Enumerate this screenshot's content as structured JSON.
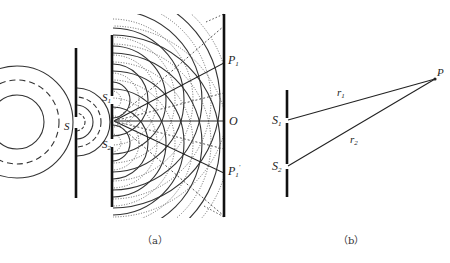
{
  "figure_a": {
    "caption": "（a）",
    "source_label": "S",
    "slit1_label": "S",
    "slit1_sub": "1",
    "slit2_label": "S",
    "slit2_sub": "2",
    "screen_labels": {
      "p1": "P",
      "p1_sub": "1",
      "o": "O",
      "p1prime": "P",
      "p1prime_sub": "1",
      "p1prime_mark": "′"
    }
  },
  "figure_b": {
    "caption": "（b）",
    "s1_label": "S",
    "s1_sub": "1",
    "s2_label": "S",
    "s2_sub": "2",
    "p_label": "P",
    "r1_label": "r",
    "r1_sub": "1",
    "r2_label": "r",
    "r2_sub": "2"
  },
  "colors": {
    "ink": "#222222",
    "background": "#ffffff"
  }
}
